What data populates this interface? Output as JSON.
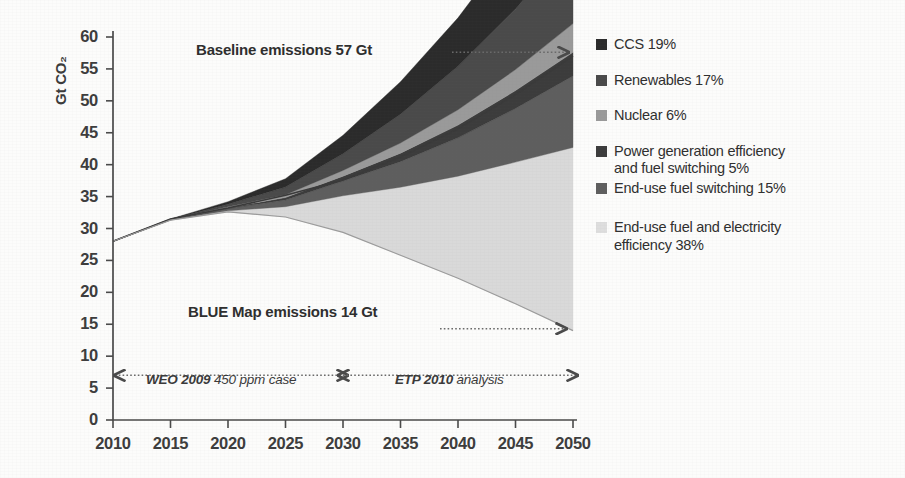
{
  "chart_data": {
    "type": "area",
    "title": "",
    "xlabel": "",
    "ylabel": "Gt CO2",
    "ylabel_display": "Gt CO₂",
    "xlim": [
      2010,
      2050
    ],
    "ylim": [
      0,
      60
    ],
    "grid": false,
    "legend_position": "right",
    "x": [
      2010,
      2015,
      2020,
      2025,
      2030,
      2035,
      2040,
      2045,
      2050
    ],
    "xticks": [
      "2010",
      "2015",
      "2020",
      "2025",
      "2030",
      "2035",
      "2040",
      "2045",
      "2050"
    ],
    "yticks": [
      "0",
      "5",
      "10",
      "15",
      "20",
      "25",
      "30",
      "35",
      "40",
      "45",
      "50",
      "55",
      "60"
    ],
    "baseline": {
      "name": "Baseline emissions",
      "values": [
        28.0,
        31.5,
        33.2,
        35.2,
        37.6,
        41.2,
        45.6,
        51.0,
        57.0
      ],
      "end_value": 57,
      "end_unit": "Gt"
    },
    "blue_map": {
      "name": "BLUE Map emissions",
      "values": [
        28.0,
        31.3,
        32.6,
        31.8,
        29.4,
        25.8,
        22.2,
        18.2,
        14.0
      ],
      "end_value": 14,
      "end_unit": "Gt"
    },
    "series": [
      {
        "name": "CCS",
        "share_pct": 19,
        "color": "#2b2b2b",
        "values": [
          0,
          0.05,
          0.4,
          1.3,
          2.9,
          5.1,
          7.6,
          10.6,
          14.2
        ]
      },
      {
        "name": "Renewables",
        "share_pct": 17,
        "color": "#4a4a4a",
        "values": [
          0,
          0.05,
          0.4,
          1.2,
          2.6,
          4.5,
          6.8,
          9.5,
          12.7
        ]
      },
      {
        "name": "Nuclear",
        "share_pct": 6,
        "color": "#9a9a9a",
        "values": [
          0,
          0.02,
          0.15,
          0.45,
          0.9,
          1.6,
          2.4,
          3.3,
          4.5
        ]
      },
      {
        "name": "Power generation efficiency and fuel switching",
        "share_pct": 5,
        "color": "#3c3c3c",
        "values": [
          0,
          0.02,
          0.12,
          0.38,
          0.77,
          1.33,
          2.0,
          2.8,
          3.7
        ]
      },
      {
        "name": "End-use fuel switching",
        "share_pct": 15,
        "color": "#5e5e5e",
        "values": [
          0,
          0.04,
          0.35,
          1.05,
          2.3,
          4.0,
          6.0,
          8.4,
          11.2
        ]
      },
      {
        "name": "End-use fuel and electricity efficiency",
        "share_pct": 38,
        "color": "#d9d9d9",
        "values": [
          0,
          0.02,
          0.18,
          1.62,
          5.73,
          10.67,
          16.0,
          22.2,
          28.7
        ]
      }
    ],
    "legend": [
      {
        "label": "CCS 19%",
        "color": "#2b2b2b"
      },
      {
        "label": "Renewables 17%",
        "color": "#4a4a4a"
      },
      {
        "label": "Nuclear 6%",
        "color": "#9a9a9a"
      },
      {
        "label": "Power generation efficiency and fuel switching 5%",
        "color": "#3c3c3c"
      },
      {
        "label": "End-use fuel switching  15%",
        "color": "#5e5e5e"
      },
      {
        "label": "End-use fuel and electricity efficiency 38%",
        "color": "#dedede"
      }
    ],
    "annotations": [
      {
        "id": "baseline-label",
        "text": "Baseline emissions 57 Gt"
      },
      {
        "id": "bluemap-label",
        "text": "BLUE Map emissions 14 Gt"
      },
      {
        "id": "weo-label",
        "text": "WEO 2009",
        "text2": " 450 ppm case",
        "range": [
          2010,
          2030
        ]
      },
      {
        "id": "etp-label",
        "text": "ETP 2010",
        "text2": " analysis",
        "range": [
          2030,
          2050
        ]
      }
    ]
  },
  "legend_lines": {
    "l0": "CCS 19%",
    "l1": "Renewables 17%",
    "l2": "Nuclear 6%",
    "l3a": "Power generation efficiency",
    "l3b": "and fuel switching 5%",
    "l4": "End-use fuel switching  15%",
    "l5a": "End-use fuel and electricity",
    "l5b": "efficiency 38%"
  },
  "axis": {
    "ylabel": "Gt CO₂"
  },
  "annotations": {
    "baseline": "Baseline emissions 57 Gt",
    "bluemap": "BLUE Map emissions 14 Gt",
    "weo_bold": "WEO 2009",
    "weo_rest": " 450 ppm case",
    "etp_bold": "ETP 2010",
    "etp_rest": " analysis"
  }
}
